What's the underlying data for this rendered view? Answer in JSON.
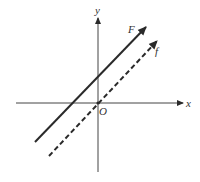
{
  "diagram": {
    "type": "coordinate-plane-parallel-lines",
    "axes": {
      "x_label": "x",
      "y_label": "y",
      "origin_label": "O"
    },
    "lines": [
      {
        "label": "F",
        "style": "solid",
        "description": "line with positive slope, y-intercept above origin, arrow pointing up-right"
      },
      {
        "label": "f",
        "style": "dashed",
        "description": "parallel line passing through origin O, arrow pointing up-right"
      }
    ],
    "colors": {
      "stroke": "#2a2a2a",
      "background": "#ffffff"
    }
  }
}
